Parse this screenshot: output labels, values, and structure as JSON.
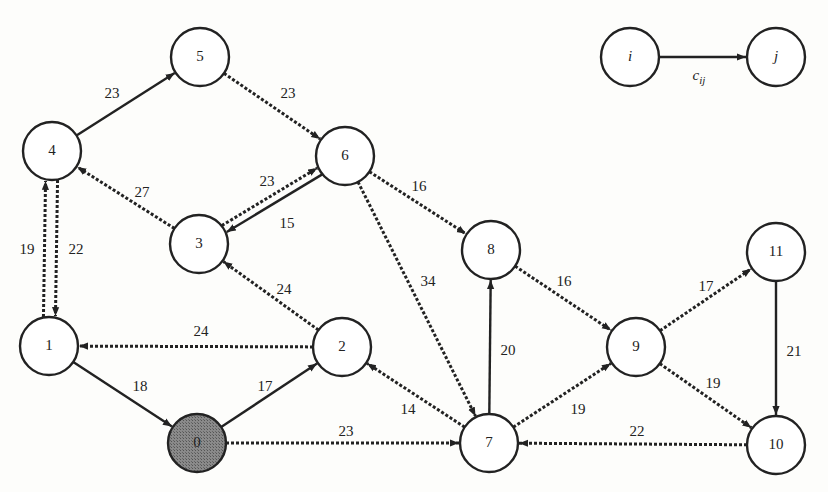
{
  "diagram": {
    "type": "directed-graph",
    "node_radius": 29,
    "colors": {
      "stroke": "#222222",
      "node_fill": "#ffffff",
      "source_fill": "#7a7a7a",
      "background": "#fdfdfb"
    },
    "nodes": [
      {
        "id": "0",
        "label": "0",
        "x": 197,
        "y": 443,
        "highlighted": true
      },
      {
        "id": "1",
        "label": "1",
        "x": 49,
        "y": 346
      },
      {
        "id": "2",
        "label": "2",
        "x": 342,
        "y": 347
      },
      {
        "id": "3",
        "label": "3",
        "x": 199,
        "y": 244
      },
      {
        "id": "4",
        "label": "4",
        "x": 52,
        "y": 151
      },
      {
        "id": "5",
        "label": "5",
        "x": 200,
        "y": 57
      },
      {
        "id": "6",
        "label": "6",
        "x": 345,
        "y": 156
      },
      {
        "id": "7",
        "label": "7",
        "x": 489,
        "y": 443
      },
      {
        "id": "8",
        "label": "8",
        "x": 491,
        "y": 250
      },
      {
        "id": "9",
        "label": "9",
        "x": 636,
        "y": 347
      },
      {
        "id": "10",
        "label": "10",
        "x": 776,
        "y": 445
      },
      {
        "id": "11",
        "label": "11",
        "x": 776,
        "y": 252
      }
    ],
    "edges": [
      {
        "from": "4",
        "to": "5",
        "cost": "23",
        "style": "solid",
        "lx": 112,
        "ly": 95
      },
      {
        "from": "5",
        "to": "6",
        "cost": "23",
        "style": "dashed",
        "lx": 288,
        "ly": 95
      },
      {
        "from": "3",
        "to": "4",
        "cost": "27",
        "style": "dashed",
        "lx": 142,
        "ly": 194
      },
      {
        "from": "6",
        "to": "3",
        "cost": "23",
        "style": "solid",
        "lx": 267,
        "ly": 183,
        "offset": -4
      },
      {
        "from": "3",
        "to": "6",
        "cost": "15",
        "style": "dashed",
        "lx": 287,
        "ly": 225,
        "offset": -4
      },
      {
        "from": "6",
        "to": "8",
        "cost": "16",
        "style": "dashed",
        "lx": 419,
        "ly": 188
      },
      {
        "from": "6",
        "to": "7",
        "cost": "34",
        "style": "dashed",
        "lx": 428,
        "ly": 283
      },
      {
        "from": "1",
        "to": "4",
        "cost": "19",
        "style": "dashed",
        "lx": 27,
        "ly": 251,
        "offset": -6
      },
      {
        "from": "4",
        "to": "1",
        "cost": "22",
        "style": "dashed",
        "lx": 76,
        "ly": 251,
        "offset": -6
      },
      {
        "from": "2",
        "to": "3",
        "cost": "24",
        "style": "dashed",
        "lx": 284,
        "ly": 291
      },
      {
        "from": "2",
        "to": "1",
        "cost": "24",
        "style": "dashed",
        "lx": 201,
        "ly": 333
      },
      {
        "from": "1",
        "to": "0",
        "cost": "18",
        "style": "solid",
        "lx": 140,
        "ly": 388
      },
      {
        "from": "0",
        "to": "2",
        "cost": "17",
        "style": "solid",
        "lx": 265,
        "ly": 388
      },
      {
        "from": "7",
        "to": "2",
        "cost": "14",
        "style": "dashed",
        "lx": 408,
        "ly": 411
      },
      {
        "from": "0",
        "to": "7",
        "cost": "23",
        "style": "dashed",
        "lx": 346,
        "ly": 433
      },
      {
        "from": "7",
        "to": "8",
        "cost": "20",
        "style": "solid",
        "lx": 508,
        "ly": 352
      },
      {
        "from": "8",
        "to": "9",
        "cost": "16",
        "style": "dashed",
        "lx": 564,
        "ly": 283
      },
      {
        "from": "7",
        "to": "9",
        "cost": "19",
        "style": "dashed",
        "lx": 578,
        "ly": 411
      },
      {
        "from": "9",
        "to": "11",
        "cost": "17",
        "style": "dashed",
        "lx": 706,
        "ly": 288
      },
      {
        "from": "9",
        "to": "10",
        "cost": "19",
        "style": "dashed",
        "lx": 713,
        "ly": 385
      },
      {
        "from": "11",
        "to": "10",
        "cost": "21",
        "style": "solid",
        "lx": 794,
        "ly": 353
      },
      {
        "from": "10",
        "to": "7",
        "cost": "22",
        "style": "dashed",
        "lx": 637,
        "ly": 433
      }
    ],
    "legend": {
      "from": {
        "label": "i",
        "x": 630,
        "y": 57
      },
      "to": {
        "label": "j",
        "x": 776,
        "y": 57
      },
      "edge_label": "c",
      "edge_label_sub": "ij"
    }
  }
}
